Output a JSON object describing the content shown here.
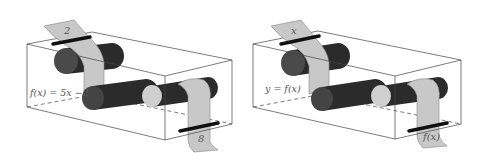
{
  "panels": [
    {
      "id": "left",
      "input_label": "2",
      "function_label": "f(x) = 5x −2",
      "output_label": "8"
    },
    {
      "id": "right",
      "input_label": "x",
      "function_label": "y = f(x)",
      "output_label": "f(x)"
    }
  ],
  "colors": {
    "box_line": "#444444",
    "roller_dark": "#2b2b2b",
    "roller_end": "#4a4a4a",
    "roller_light": "#cfcfcf",
    "tape": "#c8c8c8",
    "tape_edge": "#888888",
    "clamp": "#111111"
  }
}
